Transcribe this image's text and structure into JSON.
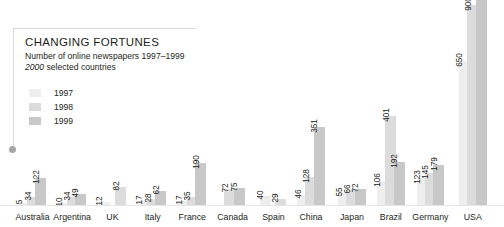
{
  "header": {
    "headline": "CHANGING FORTUNES",
    "subtitle_line1": "Number of online newspapers 1997–1999",
    "subtitle_line2_italic": "2000",
    "subtitle_line2_rest": " selected countries"
  },
  "legend": {
    "position": "top-left",
    "entries": [
      {
        "label": "1997",
        "color": "#eeeeee"
      },
      {
        "label": "1998",
        "color": "#dcdcdc"
      },
      {
        "label": "1999",
        "color": "#c8c8c8"
      }
    ]
  },
  "colors": {
    "series_1997": "#eeeeee",
    "series_1998": "#dcdcdc",
    "series_1999": "#c8c8c8",
    "text": "#231f20",
    "rule": "#d9d9d9",
    "baseline": "#e6e6e6",
    "anchor_dot": "#a6a6a6"
  },
  "chart_data": {
    "type": "bar",
    "title": "CHANGING FORTUNES",
    "subtitle": "Number of online newspapers 1997–1999, 2000 selected countries",
    "xlabel": "",
    "ylabel": "",
    "grid": false,
    "legend_position": "top-left",
    "ylim": [
      0,
      1000
    ],
    "categories": [
      "Australia",
      "Argentina",
      "UK",
      "Italy",
      "France",
      "Canada",
      "Spain",
      "China",
      "Japan",
      "Brazil",
      "Germany",
      "USA"
    ],
    "series": [
      {
        "name": "1997",
        "values": [
          5,
          10,
          12,
          17,
          17,
          null,
          40,
          46,
          55,
          106,
          123,
          650
        ]
      },
      {
        "name": "1998",
        "values": [
          34,
          34,
          null,
          28,
          35,
          72,
          29,
          128,
          66,
          401,
          145,
          900
        ]
      },
      {
        "name": "1999",
        "values": [
          122,
          49,
          82,
          62,
          190,
          75,
          null,
          351,
          72,
          192,
          179,
          1000
        ]
      }
    ],
    "data_labels": {
      "Australia": [
        "5",
        "34",
        "122"
      ],
      "Argentina": [
        "10",
        "34",
        "49"
      ],
      "UK": [
        "12",
        "",
        "82"
      ],
      "Italy": [
        "17",
        "28",
        "62"
      ],
      "France": [
        "17",
        "35",
        "190"
      ],
      "Canada": [
        "",
        "72",
        "75"
      ],
      "Spain": [
        "40",
        "29",
        ""
      ],
      "China": [
        "46",
        "128",
        "351"
      ],
      "Japan": [
        "55",
        "66",
        "72"
      ],
      "Brazil": [
        "106",
        "401",
        "192"
      ],
      "Germany": [
        "123",
        "145",
        "179"
      ],
      "USA": [
        "650",
        "900",
        "1"
      ]
    }
  },
  "groups": [
    {
      "name": "Australia",
      "label": "Australia",
      "left": 27,
      "bars": [
        {
          "series": "1997",
          "label": "5",
          "value": 5,
          "color": "#eeeeee",
          "x": 0
        },
        {
          "series": "1998",
          "label": "34",
          "value": 34,
          "color": "#dcdcdc",
          "x": 12
        },
        {
          "series": "1999",
          "label": "122",
          "value": 122,
          "color": "#c8c8c8",
          "x": 24
        }
      ]
    },
    {
      "name": "Argentina",
      "label": "Argentina",
      "left": 84,
      "bars": [
        {
          "series": "1997",
          "label": "10",
          "value": 10,
          "color": "#eeeeee",
          "x": 0
        },
        {
          "series": "1998",
          "label": "34",
          "value": 34,
          "color": "#dcdcdc",
          "x": 12
        },
        {
          "series": "1999",
          "label": "49",
          "value": 49,
          "color": "#c8c8c8",
          "x": 24
        }
      ]
    },
    {
      "name": "UK",
      "label": "UK",
      "left": 142,
      "bars": [
        {
          "series": "1997",
          "label": "12",
          "value": 12,
          "color": "#eeeeee",
          "x": 0
        },
        {
          "series": "1999",
          "label": "82",
          "value": 82,
          "color": "#dcdcdc",
          "x": 24
        }
      ]
    },
    {
      "name": "Italy",
      "label": "Italy",
      "left": 200,
      "bars": [
        {
          "series": "1997",
          "label": "17",
          "value": 17,
          "color": "#eeeeee",
          "x": 0
        },
        {
          "series": "1998",
          "label": "28",
          "value": 28,
          "color": "#dcdcdc",
          "x": 12
        },
        {
          "series": "1999",
          "label": "62",
          "value": 62,
          "color": "#c8c8c8",
          "x": 24
        }
      ]
    },
    {
      "name": "France",
      "label": "France",
      "left": 257,
      "bars": [
        {
          "series": "1997",
          "label": "17",
          "value": 17,
          "color": "#eeeeee",
          "x": 0
        },
        {
          "series": "1998",
          "label": "35",
          "value": 35,
          "color": "#dcdcdc",
          "x": 12
        },
        {
          "series": "1999",
          "label": "190",
          "value": 190,
          "color": "#c8c8c8",
          "x": 24
        }
      ]
    },
    {
      "name": "Canada",
      "label": "Canada",
      "left": 315,
      "bars": [
        {
          "series": "1998",
          "label": "72",
          "value": 72,
          "color": "#dcdcdc",
          "x": 8
        },
        {
          "series": "1999",
          "label": "75",
          "value": 75,
          "color": "#c8c8c8",
          "x": 22
        }
      ]
    },
    {
      "name": "Spain",
      "label": "Spain",
      "left": 374,
      "bars": [
        {
          "series": "1997",
          "label": "40",
          "value": 40,
          "color": "#eeeeee",
          "x": 0
        },
        {
          "series": "1998",
          "label": "29",
          "value": 29,
          "color": "#dcdcdc",
          "x": 22
        }
      ]
    },
    {
      "name": "China",
      "label": "China",
      "left": 428,
      "bars": [
        {
          "series": "1997",
          "label": "46",
          "value": 46,
          "color": "#eeeeee",
          "x": 0
        },
        {
          "series": "1998",
          "label": "128",
          "value": 128,
          "color": "#dcdcdc",
          "x": 12
        },
        {
          "series": "1999",
          "label": "351",
          "value": 351,
          "color": "#c8c8c8",
          "x": 24
        }
      ]
    },
    {
      "name": "Japan",
      "label": "Japan",
      "left": 487,
      "bars": [
        {
          "series": "1997",
          "label": "55",
          "value": 55,
          "color": "#eeeeee",
          "x": 0
        },
        {
          "series": "1998",
          "label": "66",
          "value": 66,
          "color": "#dcdcdc",
          "x": 12
        },
        {
          "series": "1999",
          "label": "72",
          "value": 72,
          "color": "#c8c8c8",
          "x": 24
        }
      ]
    },
    {
      "name": "Brazil",
      "label": "Brazil",
      "left": 543,
      "bars": [
        {
          "series": "1997",
          "label": "106",
          "value": 106,
          "color": "#eeeeee",
          "x": 0
        },
        {
          "series": "1998",
          "label": "401",
          "value": 401,
          "color": "#dcdcdc",
          "x": 12
        },
        {
          "series": "1999",
          "label": "192",
          "value": 192,
          "color": "#c8c8c8",
          "x": 24
        }
      ]
    },
    {
      "name": "Germany",
      "label": "Germany",
      "left": 600,
      "bars": [
        {
          "series": "1997",
          "label": "123",
          "value": 123,
          "color": "#eeeeee",
          "x": 0
        },
        {
          "series": "1998",
          "label": "145",
          "value": 145,
          "color": "#dcdcdc",
          "x": 12
        },
        {
          "series": "1999",
          "label": "179",
          "value": 179,
          "color": "#c8c8c8",
          "x": 24
        }
      ]
    },
    {
      "name": "USA",
      "label": "USA",
      "left": 661,
      "bars": [
        {
          "series": "1997",
          "label": "650",
          "value": 650,
          "color": "#eeeeee",
          "x": 0
        },
        {
          "series": "1998",
          "label": "900",
          "value": 900,
          "color": "#dcdcdc",
          "x": 12
        },
        {
          "series": "1999",
          "label": "1",
          "value": 1000,
          "color": "#c8c8c8",
          "x": 24
        }
      ]
    }
  ]
}
